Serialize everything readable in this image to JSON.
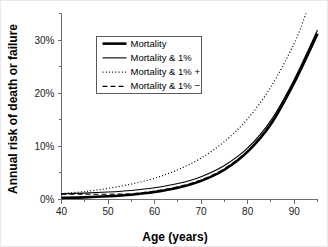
{
  "chart_data": {
    "type": "line",
    "title": "",
    "xlabel": "Age (years)",
    "ylabel": "Annual risk of death or failure",
    "xlim": [
      40,
      95
    ],
    "ylim": [
      0,
      35
    ],
    "grid": false,
    "legend_position": "upper-left-inside",
    "x_ticks": [
      40,
      50,
      60,
      70,
      80,
      90
    ],
    "x_tick_labels": [
      "40",
      "50",
      "60",
      "70",
      "80",
      "90"
    ],
    "x_minor_ticks": [
      45,
      55,
      65,
      75,
      85,
      95
    ],
    "y_ticks": [
      0,
      10,
      20,
      30
    ],
    "y_tick_labels": [
      "0%",
      "10%",
      "20%",
      "30%"
    ],
    "y_minor_ticks": [
      5,
      15,
      25,
      35
    ],
    "x": [
      40,
      45,
      50,
      55,
      60,
      65,
      70,
      75,
      80,
      85,
      90,
      95
    ],
    "series": [
      {
        "name": "Mortality",
        "style": "solid-thick",
        "stroke_width": 2.6,
        "dash": "none",
        "color": "#000000",
        "values": [
          0.3,
          0.4,
          0.6,
          0.9,
          1.4,
          2.2,
          3.5,
          5.6,
          9.0,
          14.2,
          22.0,
          31.2
        ]
      },
      {
        "name": "Mortality & 1%",
        "style": "solid-thin",
        "stroke_width": 1.1,
        "dash": "none",
        "color": "#000000",
        "values": [
          1.1,
          1.2,
          1.4,
          1.7,
          2.2,
          3.0,
          4.3,
          6.4,
          9.7,
          14.9,
          22.6,
          31.9
        ]
      },
      {
        "name": "Mortality & 1% +",
        "style": "dotted",
        "stroke_width": 1.2,
        "dash": "1,2.2",
        "color": "#000000",
        "values": [
          1.1,
          1.5,
          2.1,
          2.9,
          4.0,
          5.6,
          7.8,
          10.9,
          15.2,
          21.2,
          29.4,
          40.5
        ]
      },
      {
        "name": "Mortality & 1% −",
        "style": "dashed",
        "stroke_width": 1.1,
        "dash": "5,3",
        "color": "#000000",
        "values": [
          1.0,
          1.0,
          1.0,
          1.1,
          1.6,
          2.4,
          3.7,
          5.8,
          9.2,
          14.4,
          22.2,
          31.4
        ]
      }
    ]
  },
  "legend": {
    "entries": [
      "Mortality",
      "Mortality & 1%",
      "Mortality & 1% +",
      "Mortality & 1% −"
    ]
  },
  "axes": {
    "x_title": "Age (years)",
    "y_title": "Annual risk of death or failure"
  }
}
